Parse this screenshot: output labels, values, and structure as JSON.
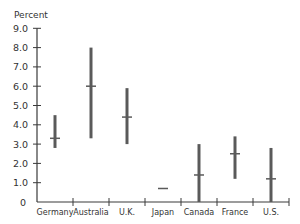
{
  "chart_data": {
    "type": "range",
    "title": "",
    "ylabel": "Percent",
    "xlabel": "",
    "ylim": [
      0,
      9
    ],
    "yticks": [
      0,
      1,
      2,
      3,
      4,
      5,
      6,
      7,
      8,
      9
    ],
    "ytick_labels": [
      "0",
      "1.0",
      "2.0",
      "3.0",
      "4.0",
      "5.0",
      "6.0",
      "7.0",
      "8.0",
      "9.0"
    ],
    "categories": [
      "Germany",
      "Australia",
      "U.K.",
      "Japan",
      "Canada",
      "France",
      "U.S."
    ],
    "series": [
      {
        "name": "high",
        "values": [
          4.5,
          8.0,
          5.9,
          0.7,
          3.0,
          3.4,
          2.8
        ]
      },
      {
        "name": "mid",
        "values": [
          3.3,
          6.0,
          4.4,
          0.7,
          1.4,
          2.5,
          1.2
        ]
      },
      {
        "name": "low",
        "values": [
          2.8,
          3.3,
          3.0,
          0.7,
          0.0,
          1.2,
          0.0
        ]
      }
    ],
    "grid": false,
    "legend": "none",
    "colors": {
      "bar": "#5a5a5a",
      "axis": "#3a3a3a",
      "text": "#333333"
    }
  }
}
